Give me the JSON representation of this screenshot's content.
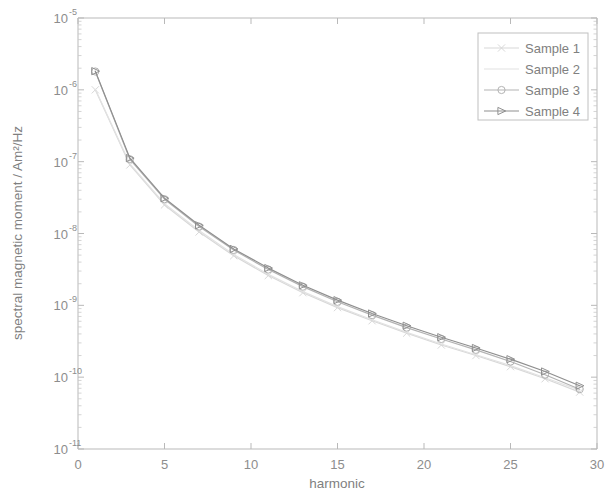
{
  "chart_data": {
    "type": "line",
    "title": "",
    "xlabel": "harmonic",
    "ylabel": "spectral magnetic moment / Am2/Hz",
    "ylabel_display": "spectral magnetic moment / Am²/Hz",
    "yscale": "log",
    "xscale": "linear",
    "xlim": [
      0,
      30
    ],
    "ylim": [
      1e-11,
      1e-05
    ],
    "grid": false,
    "legend_position": "upper right",
    "xticks": [
      0,
      5,
      10,
      15,
      20,
      25,
      30
    ],
    "xtick_labels": [
      "0",
      "5",
      "10",
      "15",
      "20",
      "25",
      "30"
    ],
    "yticks": [
      1e-05,
      1e-06,
      1e-07,
      1e-08,
      1e-09,
      1e-10,
      1e-11
    ],
    "ytick_labels": [
      "10-5",
      "10-6",
      "10-7",
      "10-8",
      "10-9",
      "10-10",
      "10-11"
    ],
    "ytick_mantissa": [
      "10",
      "10",
      "10",
      "10",
      "10",
      "10",
      "10"
    ],
    "ytick_exponents": [
      "-5",
      "-6",
      "-7",
      "-8",
      "-9",
      "-10",
      "-11"
    ],
    "x": [
      1,
      3,
      5,
      7,
      9,
      11,
      13,
      15,
      17,
      19,
      21,
      23,
      25,
      27,
      29
    ],
    "series": [
      {
        "name": "Sample 1",
        "color": "#d8d8d8",
        "marker": "x-marker",
        "values": [
          1e-06,
          9e-08,
          2.5e-08,
          1.05e-08,
          4.9e-09,
          2.6e-09,
          1.5e-09,
          9.3e-10,
          6.1e-10,
          4.1e-10,
          2.8e-10,
          2e-10,
          1.4e-10,
          9.5e-11,
          6.2e-11
        ]
      },
      {
        "name": "Sample 2",
        "color": "#e2e2e2",
        "marker": "none",
        "values": [
          1.02e-06,
          9.3e-08,
          2.6e-08,
          1.1e-08,
          5.1e-09,
          2.7e-09,
          1.55e-09,
          9.6e-10,
          6.3e-10,
          4.2e-10,
          2.9e-10,
          2.05e-10,
          1.45e-10,
          9.8e-11,
          6.6e-11
        ]
      },
      {
        "name": "Sample 3",
        "color": "#b3b3b3",
        "marker": "circle-marker",
        "values": [
          1.8e-06,
          1.08e-07,
          3e-08,
          1.25e-08,
          5.9e-09,
          3.15e-09,
          1.82e-09,
          1.12e-09,
          7.3e-10,
          4.9e-10,
          3.4e-10,
          2.4e-10,
          1.65e-10,
          1.08e-10,
          6.8e-11
        ]
      },
      {
        "name": "Sample 4",
        "color": "#8f8f8f",
        "marker": "triangle-right-marker",
        "values": [
          1.82e-06,
          1.12e-07,
          3.1e-08,
          1.3e-08,
          6.1e-09,
          3.3e-09,
          1.9e-09,
          1.18e-09,
          7.7e-10,
          5.2e-10,
          3.6e-10,
          2.55e-10,
          1.78e-10,
          1.2e-10,
          7.6e-11
        ]
      }
    ]
  },
  "legend": {
    "entries": [
      {
        "label": "Sample 1"
      },
      {
        "label": "Sample 2"
      },
      {
        "label": "Sample 3"
      },
      {
        "label": "Sample 4"
      }
    ]
  },
  "axes": {
    "x_title": "harmonic",
    "y_title": "spectral magnetic moment / Am²/Hz"
  }
}
